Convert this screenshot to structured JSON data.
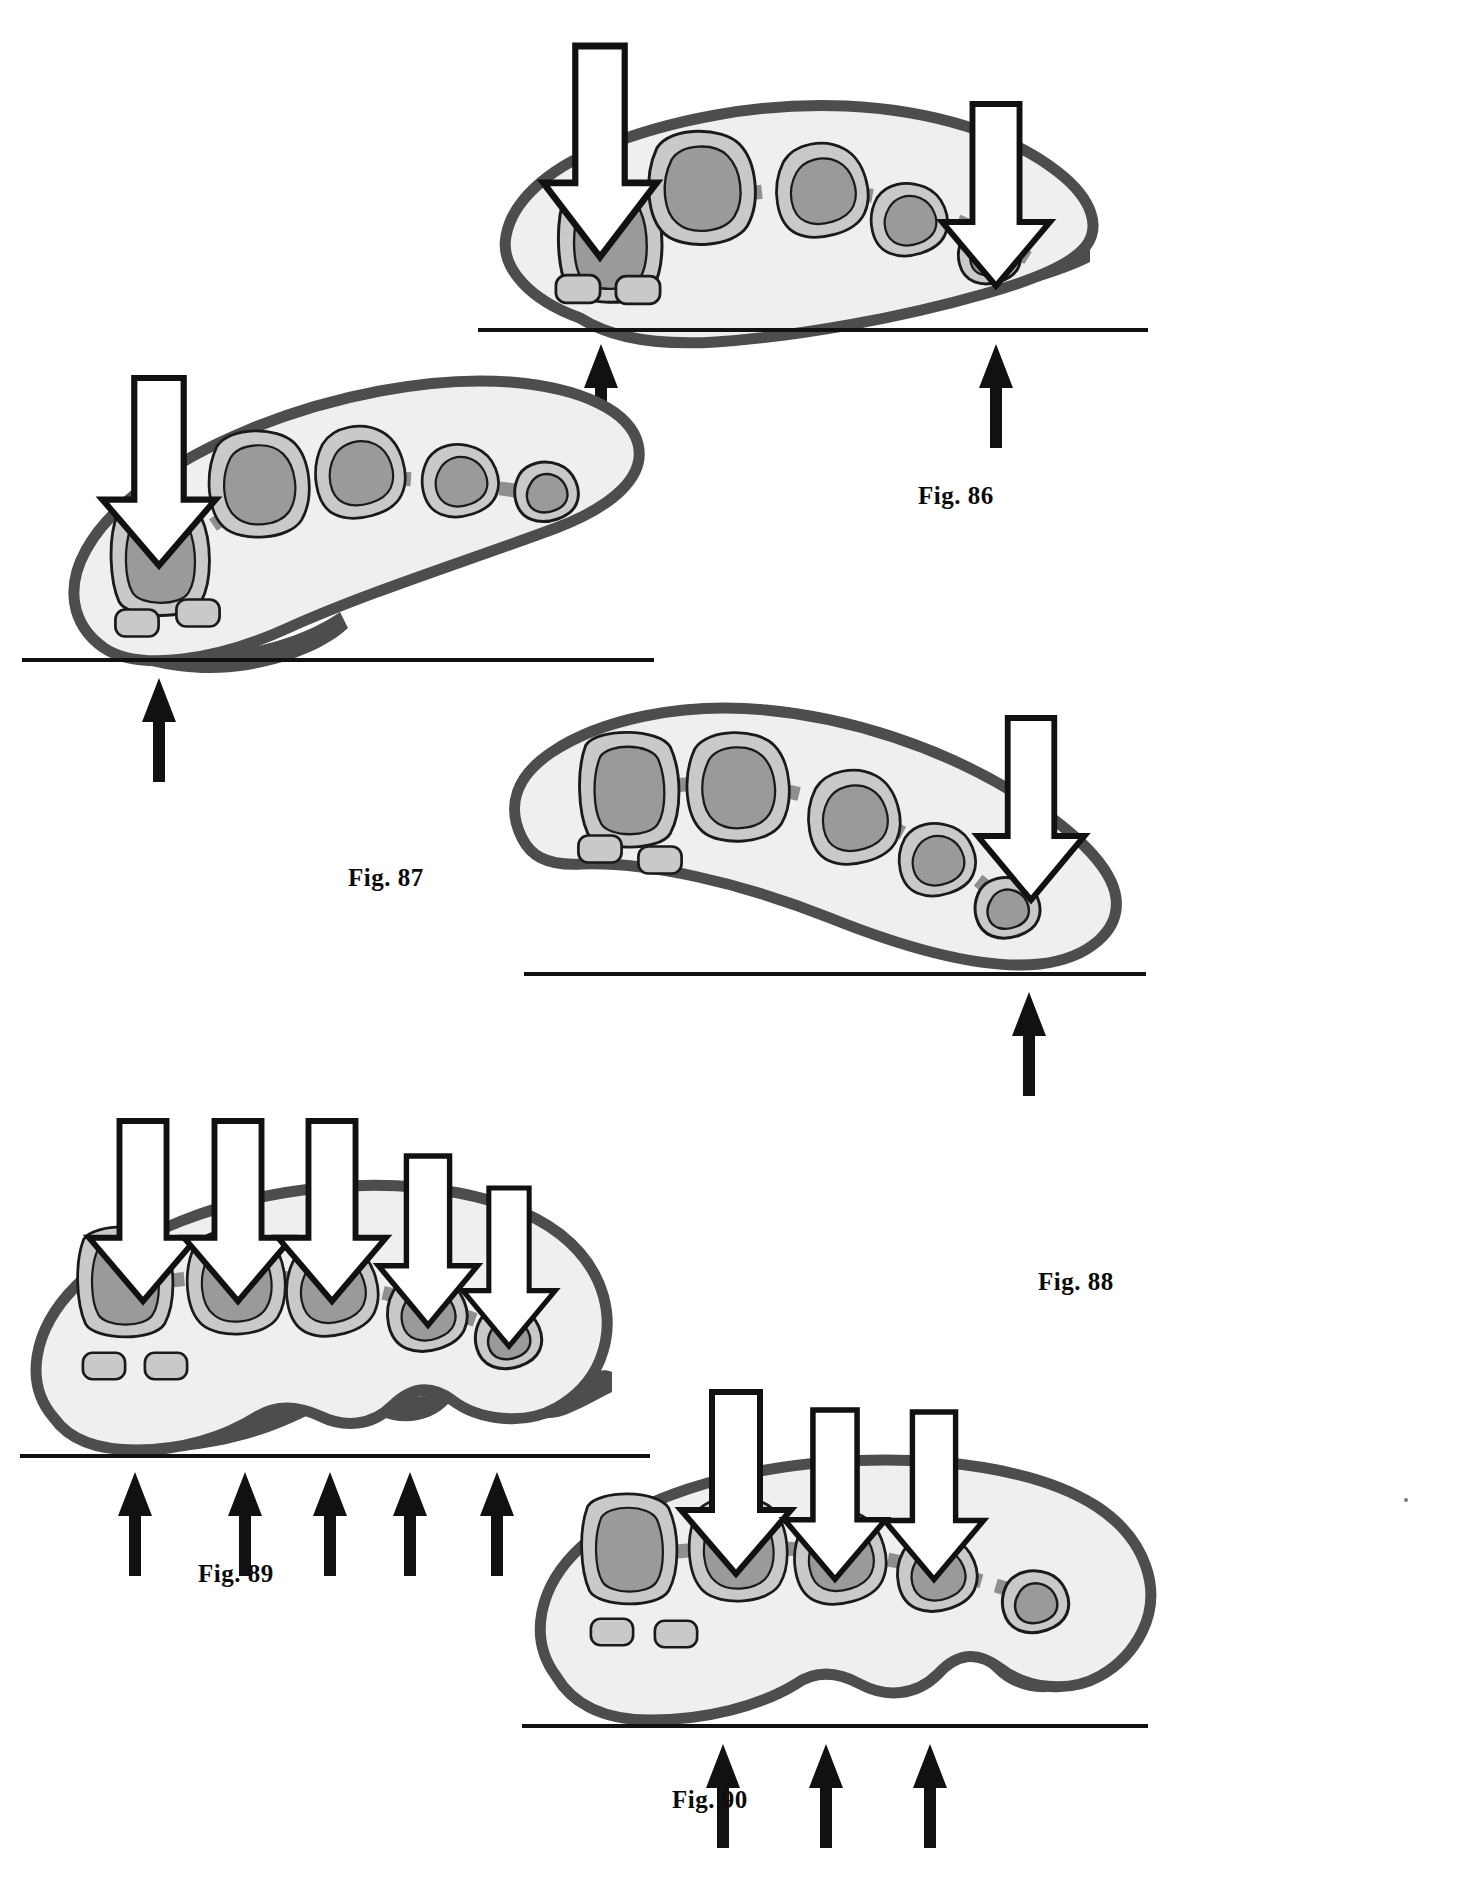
{
  "document": {
    "kind": "patent-drawing-sheet",
    "page_background": "#ffffff"
  },
  "palette": {
    "ink": "#111111",
    "capsule_outline": "#4d4d4d",
    "body_fill": "#efefef",
    "halo_fill": "#c9c9c9",
    "core_fill": "#9a9a9a",
    "dashed_line": "#8f8f8f",
    "fat_pad": "#4d4d4d",
    "arrow_fill": "#ffffff",
    "arrow_stroke": "#111111",
    "ground_line": "#111111"
  },
  "figures": [
    {
      "id": "fig-86",
      "label": "Fig. 86",
      "label_x": 918,
      "label_y": 482,
      "caption_note": "Arch cross-section with two downward load arrows and two upward reaction arrows",
      "down_arrows": 2,
      "up_arrows": 2,
      "metatarsal_count": 5,
      "sesamoid_count": 2,
      "plantar_pad": "smooth"
    },
    {
      "id": "fig-87",
      "label": "Fig. 87",
      "label_x": 348,
      "label_y": 864,
      "caption_note": "Arch cross-section with one downward load arrow at the first ray and one upward reaction arrow",
      "down_arrows": 1,
      "up_arrows": 1,
      "metatarsal_count": 5,
      "sesamoid_count": 2,
      "plantar_pad": "smooth"
    },
    {
      "id": "fig-88",
      "label": "Fig. 88",
      "label_x": 1038,
      "label_y": 1268,
      "caption_note": "Arch cross-section with one downward load arrow at the fifth ray and one upward reaction arrow",
      "down_arrows": 1,
      "up_arrows": 1,
      "metatarsal_count": 5,
      "sesamoid_count": 2,
      "plantar_pad": "wavy"
    },
    {
      "id": "fig-89",
      "label": "Fig. 89",
      "label_x": 198,
      "label_y": 1560,
      "caption_note": "Flattened cross-section with five downward load arrows and five upward reaction arrows",
      "down_arrows": 5,
      "up_arrows": 5,
      "metatarsal_count": 5,
      "sesamoid_count": 2,
      "plantar_pad": "wavy"
    },
    {
      "id": "fig-90",
      "label": "Fig. 90",
      "label_x": 672,
      "label_y": 1786,
      "caption_note": "Flattened cross-section with three downward load arrows on central rays and three upward reaction arrows",
      "down_arrows": 3,
      "up_arrows": 3,
      "metatarsal_count": 5,
      "sesamoid_count": 2,
      "plantar_pad": "wavy"
    }
  ]
}
